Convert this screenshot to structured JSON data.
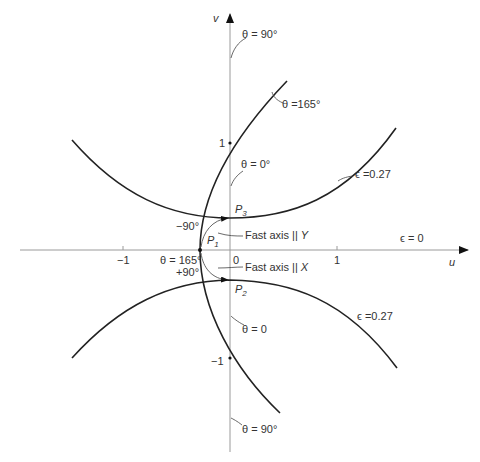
{
  "figure": {
    "axes": {
      "u_label": "u",
      "v_label": "v",
      "u_ticks": [
        {
          "value": -1,
          "label": "−1"
        },
        {
          "value": 0,
          "label": "0"
        },
        {
          "value": 1,
          "label": "1"
        }
      ],
      "v_ticks": [
        {
          "value": 1,
          "label": "1"
        },
        {
          "value": -1,
          "label": "−1"
        }
      ]
    },
    "curve_labels": {
      "theta_90_top": "θ = 90°",
      "theta_165_curve": "θ =165°",
      "theta_0_top": "θ = 0°",
      "eps_027_upper": "ϵ =0.27",
      "eps_0": "ϵ = 0",
      "eps_027_lower": "ϵ =0.27",
      "theta_0_bottom": "θ = 0",
      "theta_90_bottom": "θ = 90°",
      "theta_165_point": "θ = 165°"
    },
    "points": {
      "P1": {
        "main": "P",
        "sub": "1"
      },
      "P2": {
        "main": "P",
        "sub": "2"
      },
      "P3": {
        "main": "P",
        "sub": "3"
      }
    },
    "annotations": {
      "minus90": "−90°",
      "plus90": "+90°",
      "fast_axis_y_text": "Fast axis || ",
      "fast_axis_y_var": "Y",
      "fast_axis_x_text": "Fast axis || ",
      "fast_axis_x_var": "X"
    }
  }
}
